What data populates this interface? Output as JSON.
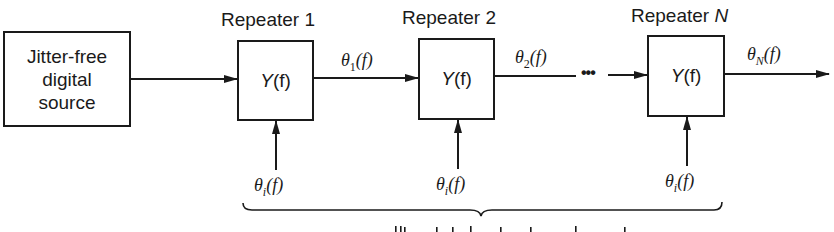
{
  "source": {
    "lines": [
      "Jitter-free",
      "digital",
      "source"
    ]
  },
  "repeaters": [
    {
      "title": "Repeater",
      "index": "1",
      "transfer": "Y(f)",
      "input_label": "θi(f)"
    },
    {
      "title": "Repeater",
      "index": "2",
      "transfer": "Y(f)",
      "input_label": "θi(f)"
    },
    {
      "title": "Repeater",
      "index": "N",
      "transfer": "Y(f)",
      "input_label": "θi(f)"
    }
  ],
  "signals": {
    "after_1": {
      "symbol": "θ",
      "sub": "1",
      "arg": "(f)"
    },
    "after_2": {
      "symbol": "θ",
      "sub": "2",
      "arg": "(f)"
    },
    "output": {
      "symbol": "θ",
      "sub": "N",
      "arg": "(f)"
    },
    "injected": {
      "symbol": "θ",
      "sub": "i",
      "arg": "(f)"
    }
  },
  "ellipsis": "•••",
  "transfer": {
    "func": "Y",
    "arg": "(f)"
  },
  "colors": {
    "ink": "#1a1a1a",
    "background": "#ffffff"
  }
}
